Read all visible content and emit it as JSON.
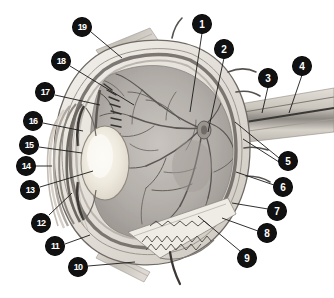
{
  "figure": {
    "background_color": "#ffffff",
    "callout_fill": "#111111",
    "callout_text_color": "#ffffff",
    "leader_line_color": "#1a1a1a",
    "width": 334,
    "height": 298
  },
  "callouts": [
    {
      "label": "1",
      "cx": 202,
      "cy": 24,
      "tip_x": 190,
      "tip_y": 112
    },
    {
      "label": "2",
      "cx": 224,
      "cy": 49,
      "tip_x": 208,
      "tip_y": 132
    },
    {
      "label": "3",
      "cx": 268,
      "cy": 78,
      "tip_x": 262,
      "tip_y": 113
    },
    {
      "label": "4",
      "cx": 302,
      "cy": 66,
      "tip_x": 289,
      "tip_y": 113
    },
    {
      "label": "5",
      "cx": 288,
      "cy": 161,
      "tip_x": 235,
      "tip_y": 122
    },
    {
      "label": "5b",
      "cx": 288,
      "cy": 161,
      "tip_x": 243,
      "tip_y": 139
    },
    {
      "label": "6",
      "cx": 283,
      "cy": 187,
      "tip_x": 236,
      "tip_y": 172
    },
    {
      "label": "7",
      "cx": 277,
      "cy": 211,
      "tip_x": 232,
      "tip_y": 203
    },
    {
      "label": "8",
      "cx": 267,
      "cy": 233,
      "tip_x": 222,
      "tip_y": 218
    },
    {
      "label": "9",
      "cx": 247,
      "cy": 258,
      "tip_x": 198,
      "tip_y": 216
    },
    {
      "label": "10",
      "cx": 78,
      "cy": 267,
      "tip_x": 135,
      "tip_y": 262
    },
    {
      "label": "11",
      "cx": 55,
      "cy": 246,
      "tip_x": 90,
      "tip_y": 235
    },
    {
      "label": "12",
      "cx": 41,
      "cy": 223,
      "tip_x": 72,
      "tip_y": 193
    },
    {
      "label": "13",
      "cx": 30,
      "cy": 190,
      "tip_x": 93,
      "tip_y": 171
    },
    {
      "label": "14",
      "cx": 26,
      "cy": 166,
      "tip_x": 52,
      "tip_y": 166
    },
    {
      "label": "15",
      "cx": 29,
      "cy": 145,
      "tip_x": 82,
      "tip_y": 153
    },
    {
      "label": "16",
      "cx": 33,
      "cy": 121,
      "tip_x": 83,
      "tip_y": 131
    },
    {
      "label": "17",
      "cx": 45,
      "cy": 92,
      "tip_x": 100,
      "tip_y": 105
    },
    {
      "label": "18",
      "cx": 61,
      "cy": 61,
      "tip_x": 134,
      "tip_y": 105
    },
    {
      "label": "19",
      "cx": 82,
      "cy": 27,
      "tip_x": 122,
      "tip_y": 58
    }
  ],
  "anatomy_regions": [
    {
      "name": "sclera",
      "tone": "#e6e2dc"
    },
    {
      "name": "cornea",
      "tone": "#dedad3"
    },
    {
      "name": "lens",
      "tone": "#efece5"
    },
    {
      "name": "vitreous-retina",
      "tone": "#b5b0ab"
    },
    {
      "name": "choroid",
      "tone": "#8e8883"
    },
    {
      "name": "optic-nerve",
      "tone": "#cdc8c1"
    },
    {
      "name": "ciliary-body",
      "tone": "#6f6a66"
    },
    {
      "name": "retinal-vessels",
      "tone": "#585350"
    }
  ]
}
